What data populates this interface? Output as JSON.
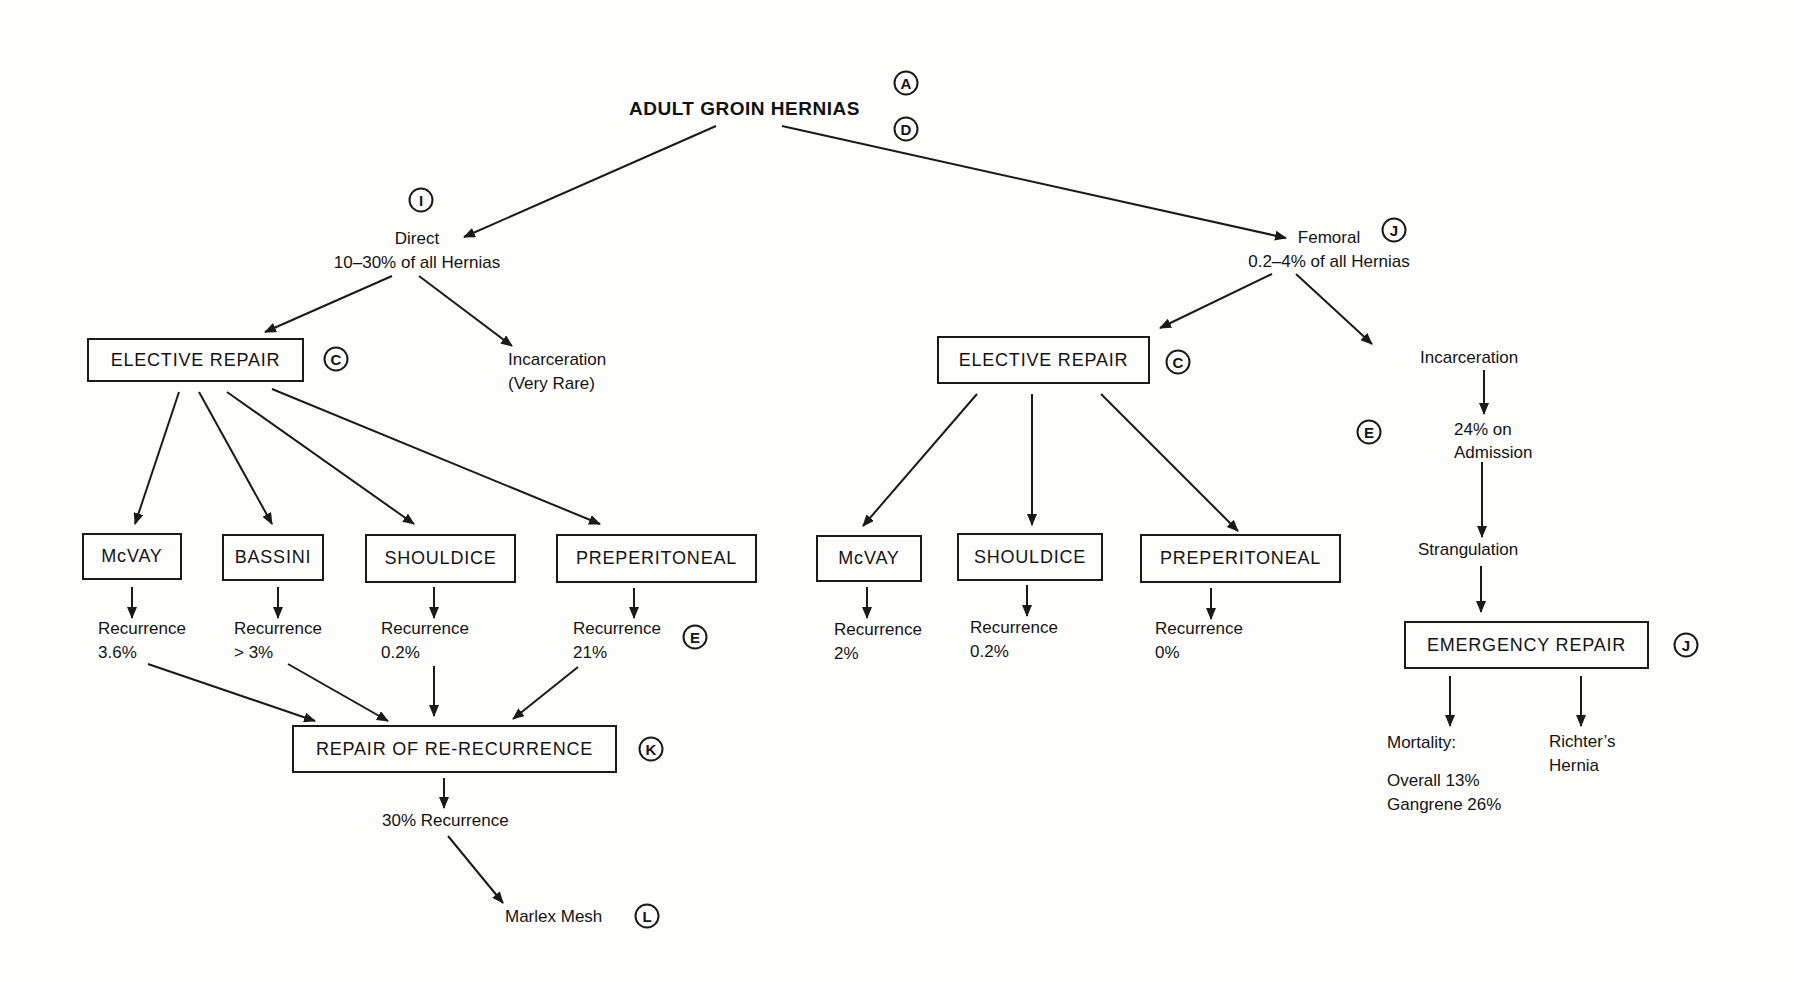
{
  "title": "ADULT GROIN HERNIAS",
  "refs": {
    "title_top": "A",
    "title_bottom": "D",
    "direct": "I",
    "femoral": "J",
    "left_elective": "C",
    "right_elective": "C",
    "preperitoneal_left": "E",
    "incarceration_right": "E",
    "emergency": "J",
    "re_recurrence": "K",
    "marlex": "L"
  },
  "direct": {
    "name": "Direct",
    "share": "10–30% of all Hernias",
    "elective_label": "ELECTIVE REPAIR",
    "incarceration": [
      "Incarceration",
      "(Very Rare)"
    ],
    "repairs": [
      {
        "label": "McVAY",
        "recurrence_label": "Recurrence",
        "recurrence_value": "3.6%"
      },
      {
        "label": "BASSINI",
        "recurrence_label": "Recurrence",
        "recurrence_value": "> 3%"
      },
      {
        "label": "SHOULDICE",
        "recurrence_label": "Recurrence",
        "recurrence_value": "0.2%"
      },
      {
        "label": "PREPERITONEAL",
        "recurrence_label": "Recurrence",
        "recurrence_value": "21%"
      }
    ],
    "re_recurrence_label": "REPAIR OF RE-RECURRENCE",
    "re_recurrence_outcome": "30% Recurrence",
    "final_treatment": "Marlex Mesh"
  },
  "femoral": {
    "name": "Femoral",
    "share": "0.2–4% of all Hernias",
    "elective_label": "ELECTIVE REPAIR",
    "repairs": [
      {
        "label": "McVAY",
        "recurrence_label": "Recurrence",
        "recurrence_value": "2%"
      },
      {
        "label": "SHOULDICE",
        "recurrence_label": "Recurrence",
        "recurrence_value": "0.2%"
      },
      {
        "label": "PREPERITONEAL",
        "recurrence_label": "Recurrence",
        "recurrence_value": "0%"
      }
    ],
    "incarceration": "Incarceration",
    "admission": [
      "24% on",
      "Admission"
    ],
    "strangulation": "Strangulation",
    "emergency_label": "EMERGENCY REPAIR",
    "mortality_label": "Mortality:",
    "mortality_overall": "Overall 13%",
    "mortality_gangrene": "Gangrene 26%",
    "richters": [
      "Richter’s",
      "Hernia"
    ]
  }
}
